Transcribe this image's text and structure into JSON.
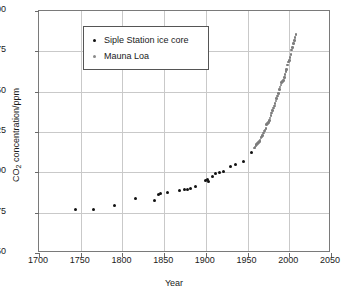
{
  "chart_data": {
    "type": "scatter",
    "title": "",
    "xlabel": "Year",
    "ylabel": "CO2 concentration/ppm",
    "ylabel_parts": {
      "prefix": "CO",
      "sub": "2",
      "suffix": " concentration/ppm"
    },
    "xlim": [
      1700,
      2050
    ],
    "ylim": [
      250,
      400
    ],
    "xticks": [
      1700,
      1750,
      1800,
      1850,
      1900,
      1950,
      2000,
      2050
    ],
    "yticks": [
      250,
      275,
      300,
      325,
      350,
      375,
      400
    ],
    "grid": true,
    "legend_position": "top-left",
    "series": [
      {
        "name": "Siple Station ice core",
        "color": "#111111",
        "marker": "circle",
        "points": [
          [
            1744,
            277.0
          ],
          [
            1765,
            277.0
          ],
          [
            1791,
            279.6
          ],
          [
            1816,
            283.6
          ],
          [
            1839,
            282.8
          ],
          [
            1843,
            286.4
          ],
          [
            1846,
            286.6
          ],
          [
            1854,
            287.6
          ],
          [
            1869,
            289.0
          ],
          [
            1874,
            289.2
          ],
          [
            1878,
            289.6
          ],
          [
            1881,
            289.8
          ],
          [
            1888,
            291.4
          ],
          [
            1899,
            295.2
          ],
          [
            1902,
            295.4
          ],
          [
            1903,
            294.6
          ],
          [
            1908,
            297.6
          ],
          [
            1912,
            299.0
          ],
          [
            1916,
            299.8
          ],
          [
            1921,
            300.8
          ],
          [
            1930,
            303.8
          ],
          [
            1936,
            304.8
          ],
          [
            1945,
            306.8
          ],
          [
            1955,
            312.6
          ]
        ]
      },
      {
        "name": "Mauna Loa",
        "color": "#7d7d7d",
        "marker": "circle",
        "points": [
          [
            1958,
            315.0
          ],
          [
            1959,
            315.8
          ],
          [
            1960,
            316.6
          ],
          [
            1961,
            317.3
          ],
          [
            1962,
            318.0
          ],
          [
            1963,
            318.6
          ],
          [
            1964,
            319.2
          ],
          [
            1965,
            320.0
          ],
          [
            1966,
            321.2
          ],
          [
            1967,
            322.0
          ],
          [
            1968,
            322.9
          ],
          [
            1969,
            324.3
          ],
          [
            1970,
            325.5
          ],
          [
            1971,
            326.2
          ],
          [
            1972,
            327.3
          ],
          [
            1973,
            329.5
          ],
          [
            1974,
            330.1
          ],
          [
            1975,
            331.0
          ],
          [
            1976,
            332.0
          ],
          [
            1977,
            333.7
          ],
          [
            1978,
            335.3
          ],
          [
            1979,
            336.7
          ],
          [
            1980,
            338.5
          ],
          [
            1981,
            339.8
          ],
          [
            1982,
            341.0
          ],
          [
            1983,
            342.6
          ],
          [
            1984,
            344.2
          ],
          [
            1985,
            345.8
          ],
          [
            1986,
            347.2
          ],
          [
            1987,
            349.0
          ],
          [
            1988,
            351.4
          ],
          [
            1989,
            353.0
          ],
          [
            1990,
            354.2
          ],
          [
            1991,
            355.5
          ],
          [
            1992,
            356.3
          ],
          [
            1993,
            357.0
          ],
          [
            1994,
            358.8
          ],
          [
            1995,
            360.7
          ],
          [
            1996,
            362.5
          ],
          [
            1997,
            363.7
          ],
          [
            1998,
            366.6
          ],
          [
            1999,
            368.3
          ],
          [
            2000,
            369.5
          ],
          [
            2001,
            371.0
          ],
          [
            2002,
            373.2
          ],
          [
            2003,
            375.8
          ],
          [
            2004,
            377.5
          ],
          [
            2005,
            379.7
          ],
          [
            2006,
            381.8
          ],
          [
            2007,
            383.7
          ],
          [
            2008,
            385.5
          ]
        ]
      }
    ]
  },
  "legend": {
    "items": [
      {
        "label": "Siple Station ice core",
        "color": "#111111"
      },
      {
        "label": "Mauna Loa",
        "color": "#8a8a8a"
      }
    ]
  },
  "axes": {
    "x_title": "Year",
    "y_title_prefix": "CO",
    "y_title_sub": "2",
    "y_title_suffix": " concentration/ppm"
  }
}
